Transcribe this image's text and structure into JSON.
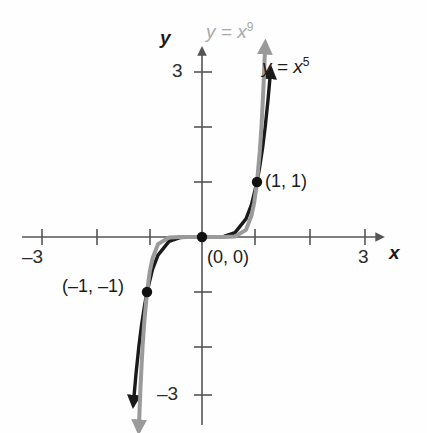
{
  "figure": {
    "background_color": "#fefefe",
    "width": 427,
    "height": 433
  },
  "axes": {
    "x_axis_name": "x",
    "y_axis_name": "y",
    "x_tick_left_label": "–3",
    "x_tick_right_label": "3",
    "y_tick_top_label": "3",
    "y_tick_bottom_label": "–3",
    "axis_color": "#555555",
    "origin_px": {
      "x": 202,
      "y": 237
    },
    "unit_px": 55,
    "x_ticks": [
      -3,
      -2,
      -1,
      1,
      2,
      3
    ],
    "y_ticks": [
      3,
      2,
      1,
      -1,
      -2,
      -3
    ],
    "xlim": [
      -3.5,
      3.6
    ],
    "ylim": [
      -3.6,
      3.4
    ]
  },
  "curves": [
    {
      "id": "x9",
      "label_var": "y",
      "label_eq": "=",
      "label_base": "x",
      "label_exp": "9",
      "label_text": "y = x⁹",
      "color": "#9a9a9a",
      "width": 4,
      "exponent": 9,
      "arrow_both_ends": true
    },
    {
      "id": "x5",
      "label_var": "y",
      "label_eq": "=",
      "label_base": "x",
      "label_exp": "5",
      "label_text": "y = x⁵",
      "color": "#1a1a1a",
      "width": 3.4,
      "exponent": 5,
      "arrow_both_ends": true
    }
  ],
  "points": [
    {
      "id": "p-neg1",
      "label": "(–1, –1)",
      "x": -1,
      "y": -1
    },
    {
      "id": "p-origin",
      "label": "(0, 0)",
      "x": 0,
      "y": 0
    },
    {
      "id": "p-pos1",
      "label": "(1, 1)",
      "x": 1,
      "y": 1
    }
  ],
  "chart_data": {
    "type": "line",
    "title": "",
    "xlabel": "x",
    "ylabel": "y",
    "xlim": [
      -3.5,
      3.6
    ],
    "ylim": [
      -3.6,
      3.4
    ],
    "grid": false,
    "legend": "inline-labels",
    "xticks": [
      -3,
      -2,
      -1,
      0,
      1,
      2,
      3
    ],
    "yticks": [
      -3,
      -2,
      -1,
      0,
      1,
      2,
      3
    ],
    "xtick_labels": [
      "–3",
      "",
      "",
      "",
      "",
      "",
      "3"
    ],
    "ytick_labels": [
      "–3",
      "",
      "",
      "",
      "",
      "",
      "3"
    ],
    "annotations": [
      "(–1, –1)",
      "(0, 0)",
      "(1, 1)"
    ],
    "series": [
      {
        "name": "y = x⁵",
        "color": "#1a1a1a",
        "x": [
          -1.25,
          -1.2,
          -1.15,
          -1.1,
          -1.05,
          -1.0,
          -0.9,
          -0.8,
          -0.6,
          -0.4,
          -0.2,
          0.0,
          0.2,
          0.4,
          0.6,
          0.8,
          0.9,
          1.0,
          1.05,
          1.1,
          1.15,
          1.2,
          1.25
        ],
        "values": [
          -3.05,
          -2.49,
          -2.01,
          -1.61,
          -1.28,
          -1.0,
          -0.59,
          -0.33,
          -0.08,
          -0.01,
          0.0,
          0.0,
          0.0,
          0.01,
          0.08,
          0.33,
          0.59,
          1.0,
          1.28,
          1.61,
          2.01,
          2.49,
          3.05
        ]
      },
      {
        "name": "y = x⁹",
        "color": "#9a9a9a",
        "x": [
          -1.15,
          -1.12,
          -1.1,
          -1.08,
          -1.05,
          -1.0,
          -0.95,
          -0.9,
          -0.8,
          -0.6,
          -0.4,
          -0.2,
          0.0,
          0.2,
          0.4,
          0.6,
          0.8,
          0.9,
          0.95,
          1.0,
          1.05,
          1.08,
          1.1,
          1.12,
          1.15
        ],
        "values": [
          -3.52,
          -2.78,
          -2.36,
          -1.99,
          -1.55,
          -1.0,
          -0.63,
          -0.39,
          -0.13,
          -0.01,
          0.0,
          0.0,
          0.0,
          0.0,
          0.0,
          0.01,
          0.13,
          0.39,
          0.63,
          1.0,
          1.55,
          1.99,
          2.36,
          2.78,
          3.52
        ]
      }
    ]
  }
}
